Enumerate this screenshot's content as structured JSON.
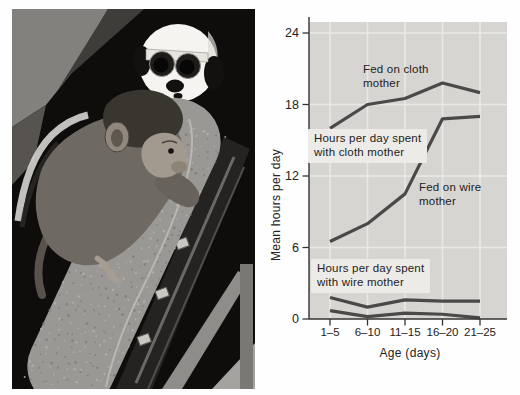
{
  "palette": {
    "page_bg": "#fefefe",
    "plot_bg": "#d7d5d2",
    "grid_line": "#e9e8e5",
    "data_line": "#4a4947",
    "axis_line": "#343332",
    "text": "#232220",
    "label_box_bg": "#edebe7",
    "photo_bg": "#0e0d0c",
    "photo_cloth": "#9a9894",
    "photo_head": "#f5f4f1"
  },
  "chart_data": {
    "type": "line",
    "title": "",
    "xlabel": "Age (days)",
    "ylabel": "Mean hours per day",
    "categories": [
      "1–5",
      "6–10",
      "11–15",
      "16–20",
      "21–25"
    ],
    "yticks": [
      0,
      6,
      12,
      18,
      24
    ],
    "ylim": [
      0,
      25.5
    ],
    "grid": true,
    "legend_position": "inline-annotations",
    "series": [
      {
        "name": "Fed on cloth mother — hours per day with cloth mother",
        "values": [
          16,
          18,
          18.5,
          19.8,
          19
        ]
      },
      {
        "name": "Fed on wire mother — hours per day with cloth mother",
        "values": [
          6.5,
          8,
          10.5,
          16.8,
          17
        ]
      },
      {
        "name": "Hours per day with wire mother — upper line",
        "values": [
          1.8,
          1.0,
          1.6,
          1.5,
          1.5
        ]
      },
      {
        "name": "Hours per day with wire mother — lower line",
        "values": [
          0.7,
          0.2,
          0.5,
          0.4,
          0.1
        ]
      }
    ],
    "annotations": {
      "fed_cloth": "Fed on cloth\nmother",
      "cloth_box": "Hours per day spent\nwith cloth mother",
      "fed_wire": "Fed on wire\nmother",
      "wire_box": "Hours per day spent\nwith wire mother"
    }
  }
}
